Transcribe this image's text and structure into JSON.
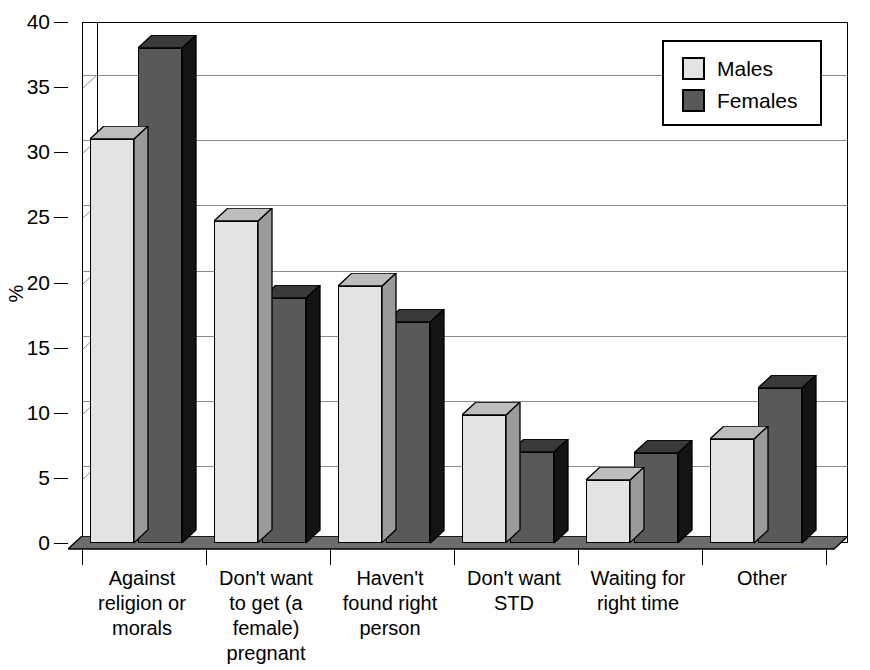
{
  "chart_data": {
    "type": "bar",
    "title": "",
    "xlabel": "",
    "ylabel": "%",
    "ylim": [
      0,
      40
    ],
    "yticks": [
      0,
      5,
      10,
      15,
      20,
      25,
      30,
      35,
      40
    ],
    "ytick_labels": [
      "0",
      "5",
      "10",
      "15",
      "20",
      "25",
      "30",
      "35",
      "40"
    ],
    "grid": true,
    "legend_position": "top-right",
    "categories": [
      "Against religion or morals",
      "Don't want to get (a female) pregnant",
      "Haven't found right person",
      "Don't want STD",
      "Waiting for right time",
      "Other"
    ],
    "category_lines": [
      [
        "Against",
        "religion or",
        "morals"
      ],
      [
        "Don't want",
        "to get (a",
        "female)",
        "pregnant"
      ],
      [
        "Haven't",
        "found right",
        "person"
      ],
      [
        "Don't want",
        "STD"
      ],
      [
        "Waiting for",
        "right time"
      ],
      [
        "Other"
      ]
    ],
    "series": [
      {
        "name": "Males",
        "color": "#e3e3e3",
        "values": [
          31,
          24.7,
          19.7,
          9.8,
          4.8,
          8
        ]
      },
      {
        "name": "Females",
        "color": "#595959",
        "values": [
          38,
          18.8,
          17,
          7,
          6.9,
          11.9
        ]
      }
    ]
  },
  "legend": {
    "items": [
      {
        "label": "Males",
        "swatch": "light-gray-swatch"
      },
      {
        "label": "Females",
        "swatch": "dark-gray-swatch"
      }
    ]
  }
}
